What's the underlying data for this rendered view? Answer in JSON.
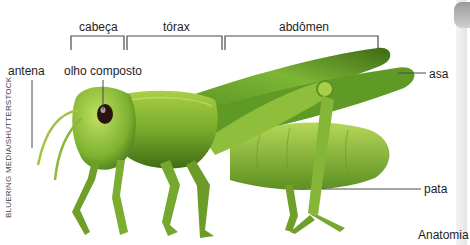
{
  "figure": {
    "title_partial": "Anatomia",
    "credit": "BLUERING MEDIA/SHUTTERSTOCK"
  },
  "brackets": [
    {
      "label": "cabeça"
    },
    {
      "label": "tórax"
    },
    {
      "label": "abdômen"
    }
  ],
  "labels": {
    "antena": "antena",
    "olho": "olho composto",
    "asa": "asa",
    "pata": "pata"
  },
  "colors": {
    "body_light": "#9cc43a",
    "body_mid": "#6fa52a",
    "body_dark": "#3f6e16",
    "leader": "#4a4a4a",
    "eye": "#2a1410"
  }
}
